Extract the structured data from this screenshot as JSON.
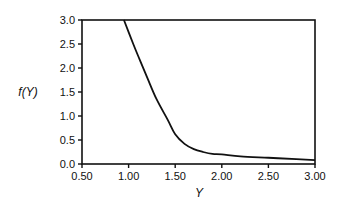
{
  "chart_data": {
    "type": "line",
    "title": "",
    "xlabel": "Y",
    "ylabel": "f(Y)",
    "xlim": [
      0.5,
      3.0
    ],
    "ylim": [
      0.0,
      3.0
    ],
    "grid": false,
    "legend": null,
    "xticks": [
      "0.50",
      "1.00",
      "1.50",
      "2.00",
      "2.50",
      "3.00"
    ],
    "yticks": [
      "0.0",
      "0.5",
      "1.0",
      "1.5",
      "2.0",
      "2.5",
      "3.0"
    ],
    "series": [
      {
        "name": "f(Y)",
        "color": "#111111",
        "x": [
          0.95,
          1.05,
          1.12,
          1.2,
          1.3,
          1.42,
          1.5,
          1.6,
          1.7,
          1.8,
          1.9,
          2.0,
          2.2,
          2.5,
          2.8,
          3.0
        ],
        "y": [
          3.0,
          2.5,
          2.17,
          1.8,
          1.35,
          0.92,
          0.62,
          0.42,
          0.31,
          0.25,
          0.21,
          0.2,
          0.16,
          0.13,
          0.1,
          0.08
        ]
      }
    ]
  }
}
